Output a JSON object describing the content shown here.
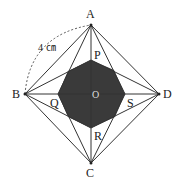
{
  "diagram": {
    "labels": {
      "A": "A",
      "B": "B",
      "C": "C",
      "D": "D",
      "P": "P",
      "Q": "Q",
      "R": "R",
      "S": "S",
      "O": "O"
    },
    "side_length": "4 ㎝",
    "colors": {
      "line": "#333333",
      "fill": "#3a3a3a",
      "dash": "#555555"
    },
    "points": {
      "A": [
        91,
        25
      ],
      "B": [
        25,
        94
      ],
      "C": [
        91,
        163
      ],
      "D": [
        159,
        94
      ],
      "P": [
        91,
        60
      ],
      "Q": [
        58,
        94
      ],
      "R": [
        91,
        128
      ],
      "S": [
        125,
        94
      ],
      "O": [
        91,
        94
      ]
    }
  }
}
